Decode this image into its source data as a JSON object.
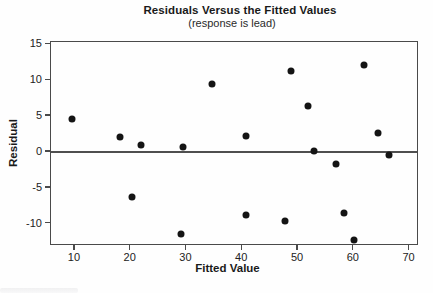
{
  "figure": {
    "title": "Residuals Versus the Fitted Values",
    "subtitle": "(response is lead)"
  },
  "chart_data": {
    "type": "scatter",
    "title": "Residuals Versus the Fitted Values",
    "subtitle": "(response is lead)",
    "xlabel": "Fitted Value",
    "ylabel": "Residual",
    "xlim": [
      5.7,
      71.7
    ],
    "ylim": [
      -13.1,
      15.4
    ],
    "xticks": [
      10,
      20,
      30,
      40,
      50,
      60,
      70
    ],
    "yticks": [
      15,
      10,
      5,
      0,
      -5,
      -10
    ],
    "grid": false,
    "reference_line_y": 0,
    "legend": "none",
    "marker": "filled-circle",
    "points": [
      {
        "x": 9.5,
        "y": 4.6
      },
      {
        "x": 18.0,
        "y": 2.1
      },
      {
        "x": 21.9,
        "y": 1.0
      },
      {
        "x": 29.3,
        "y": 0.7
      },
      {
        "x": 34.5,
        "y": 9.5
      },
      {
        "x": 20.2,
        "y": -6.3
      },
      {
        "x": 29.1,
        "y": -11.4
      },
      {
        "x": 40.6,
        "y": 2.2
      },
      {
        "x": 40.6,
        "y": -8.8
      },
      {
        "x": 47.6,
        "y": -9.6
      },
      {
        "x": 48.8,
        "y": 11.3
      },
      {
        "x": 51.8,
        "y": 6.4
      },
      {
        "x": 52.8,
        "y": 0.1
      },
      {
        "x": 56.8,
        "y": -1.7
      },
      {
        "x": 58.3,
        "y": -8.5
      },
      {
        "x": 60.1,
        "y": -12.3
      },
      {
        "x": 61.9,
        "y": 12.1
      },
      {
        "x": 64.3,
        "y": 2.7
      },
      {
        "x": 66.4,
        "y": -0.4
      }
    ]
  },
  "colors": {
    "point": "#141414",
    "frame": "#4a4a4a",
    "zero_line": "#4f4f4f",
    "text": "#1a1a1a",
    "background": "#fefefe"
  }
}
